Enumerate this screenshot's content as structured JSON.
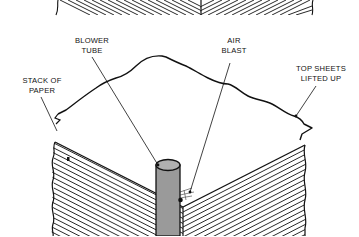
{
  "diagram": {
    "type": "technical-illustration",
    "labels": {
      "blower_tube": {
        "line1": "BLOWER",
        "line2": "TUBE"
      },
      "air_blast": {
        "line1": "AIR",
        "line2": "BLAST"
      },
      "stack_of_paper": {
        "line1": "STACK OF",
        "line2": "PAPER"
      },
      "top_sheets": {
        "line1": "TOP SHEETS",
        "line2": "LIFTED UP"
      }
    },
    "colors": {
      "ink": "#111111",
      "tube_fill": "#9a9a9a",
      "tube_top": "#b0b0b0",
      "background": "#ffffff"
    }
  }
}
